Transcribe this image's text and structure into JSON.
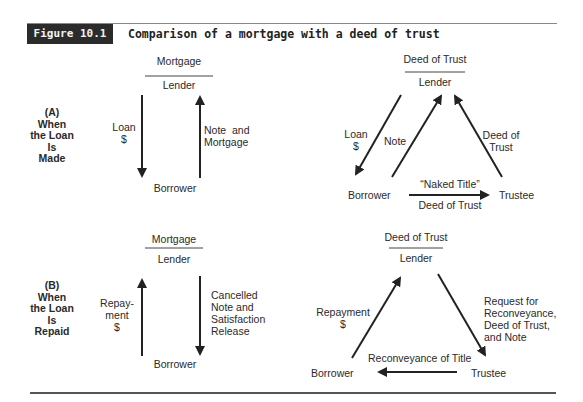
{
  "figure": {
    "badge": "Figure 10.1",
    "title": "Comparison of a mortgage with a deed of trust"
  },
  "sections": [
    {
      "label_lines": [
        "(A)",
        "When",
        "the Loan",
        "Is",
        "Made"
      ],
      "mortgage": {
        "header": "Mortgage",
        "top_party": "Lender",
        "bottom_party": "Borrower",
        "arrows": [
          {
            "direction": "down",
            "from": "Lender",
            "to": "Borrower",
            "label_lines": [
              "Loan",
              "$"
            ]
          },
          {
            "direction": "up",
            "from": "Borrower",
            "to": "Lender",
            "label_lines": [
              "Note  and",
              "Mortgage"
            ]
          }
        ]
      },
      "deed_of_trust": {
        "header": "Deed of Trust",
        "top_party": "Lender",
        "left_party": "Borrower",
        "right_party": "Trustee",
        "arrows": [
          {
            "from": "Lender",
            "to": "Borrower",
            "label_lines": [
              "Loan",
              "$"
            ]
          },
          {
            "from": "Borrower",
            "to": "Lender",
            "label_lines": [
              "Note"
            ]
          },
          {
            "from": "Trustee",
            "to": "Lender",
            "label_lines": [
              "Deed of",
              "Trust"
            ]
          },
          {
            "from": "Borrower",
            "to": "Trustee",
            "label_top": "“Naked Title”",
            "label_bottom": "Deed of Trust"
          }
        ]
      }
    },
    {
      "label_lines": [
        "(B)",
        "When",
        "the Loan",
        "Is",
        "Repaid"
      ],
      "mortgage": {
        "header": "Mortgage",
        "top_party": "Lender",
        "bottom_party": "Borrower",
        "arrows": [
          {
            "direction": "up",
            "from": "Borrower",
            "to": "Lender",
            "label_lines": [
              "Repay-",
              "ment",
              "$"
            ]
          },
          {
            "direction": "down",
            "from": "Lender",
            "to": "Borrower",
            "label_lines": [
              "Cancelled",
              "Note and",
              "Satisfaction",
              "Release"
            ]
          }
        ]
      },
      "deed_of_trust": {
        "header": "Deed of Trust",
        "top_party": "Lender",
        "left_party": "Borrower",
        "right_party": "Trustee",
        "arrows": [
          {
            "from": "Borrower",
            "to": "Lender",
            "label_lines": [
              "Repayment",
              "$"
            ]
          },
          {
            "from": "Lender",
            "to": "Trustee",
            "label_lines": [
              "Request for",
              "Reconveyance,",
              "Deed of Trust,",
              "and Note"
            ]
          },
          {
            "from": "Trustee",
            "to": "Borrower",
            "label_top": "Reconveyance of Title"
          }
        ]
      }
    }
  ],
  "colors": {
    "badge_bg": "#2b2b2b",
    "badge_text": "#f2f2f2",
    "ink": "#222222",
    "rule": "#555555"
  }
}
